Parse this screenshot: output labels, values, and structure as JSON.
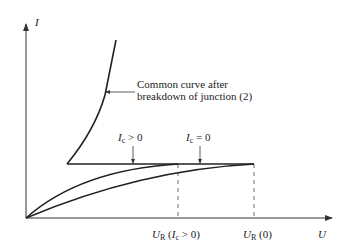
{
  "axes": {
    "y_label": "I",
    "x_label": "U"
  },
  "annotation": {
    "line1": "Common curve after",
    "line2": "breakdown of junction (2)"
  },
  "curve_labels": {
    "ic_pos": {
      "sym": "I",
      "sub": "c",
      "rel": " > 0"
    },
    "ic_zero": {
      "sym": "I",
      "sub": "c",
      "rel": " = 0"
    }
  },
  "x_ticks": {
    "ug_ic": {
      "sym": "U",
      "sub": "R",
      "arg_pre": " (",
      "arg_sym": "I",
      "arg_sub": "c",
      "arg_post": " > 0)"
    },
    "ug_0": {
      "sym": "U",
      "sub": "R",
      "arg": " (0)"
    }
  },
  "colors": {
    "line": "#222222"
  }
}
